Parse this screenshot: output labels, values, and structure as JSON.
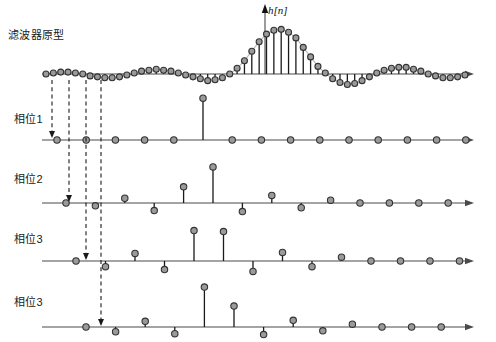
{
  "figure": {
    "title_label": "滤波器原型",
    "signal_label": "h[n]",
    "row_labels": [
      "相位1",
      "相位2",
      "相位3",
      "相位3"
    ],
    "colors": {
      "axis": "#4a4a4a",
      "stem": "#1a1a1a",
      "marker_fill": "#9a9a9a",
      "marker_stroke": "#333333",
      "envelope": "#b9b9b9",
      "dashed": "#1a1a1a",
      "text": "#1a1a1a"
    },
    "icons": {
      "axis_arrow": "axis-arrow-icon",
      "down_arrow": "down-arrow-icon",
      "up_arrow": "up-arrow-icon"
    }
  },
  "chart_data": {
    "type": "scatter",
    "title": "滤波器原型",
    "xlabel": "",
    "ylabel": "h[n]",
    "grid": false,
    "legend": false,
    "prototype": {
      "name": "h[n]",
      "baseline_y": 74,
      "x_start": 46,
      "x_step": 7.35,
      "ylim": [
        -14,
        52
      ],
      "values": [
        0,
        1,
        2,
        2,
        1,
        0,
        -2,
        -3,
        -4,
        -4,
        -3,
        -1,
        1,
        3,
        4,
        5,
        4,
        3,
        1,
        -1,
        -3,
        -5,
        -7,
        -6,
        -4,
        0,
        6,
        14,
        24,
        34,
        42,
        46,
        47,
        44,
        38,
        28,
        18,
        8,
        1,
        -5,
        -9,
        -11,
        -10,
        -7,
        -3,
        1,
        4,
        6,
        7,
        7,
        5,
        3,
        0,
        -2,
        -4,
        -4,
        -3,
        -1,
        1,
        3,
        4,
        4,
        3,
        2,
        0
      ]
    },
    "phases": [
      {
        "name": "相位1",
        "baseline_y": 140,
        "x_start": 57,
        "x_step": 29.2,
        "ylim": [
          -8,
          50
        ],
        "values": [
          0,
          0,
          0,
          0,
          0,
          44,
          0,
          0,
          0,
          0,
          0,
          0,
          0,
          0,
          0
        ]
      },
      {
        "name": "相位2",
        "baseline_y": 203,
        "x_start": 66,
        "x_step": 29.4,
        "ylim": [
          -14,
          44
        ],
        "values": [
          0,
          -3,
          5,
          -8,
          17,
          38,
          -9,
          8,
          -5,
          3,
          0,
          0,
          0,
          0,
          0
        ]
      },
      {
        "name": "相位3",
        "baseline_y": 261,
        "x_start": 76,
        "x_step": 29.5,
        "ylim": [
          -14,
          44
        ],
        "values": [
          0,
          -6,
          8,
          -9,
          32,
          31,
          -11,
          9,
          -6,
          4,
          0,
          0,
          0,
          0,
          0
        ]
      },
      {
        "name": "相位3",
        "baseline_y": 327,
        "x_start": 86,
        "x_step": 29.6,
        "ylim": [
          -12,
          46
        ],
        "values": [
          0,
          -5,
          6,
          -7,
          42,
          22,
          -8,
          7,
          -4,
          3,
          0,
          0,
          0,
          0,
          0
        ]
      }
    ],
    "routing_arrows": [
      {
        "x": 52,
        "y_start": 80,
        "y_end": 132,
        "target_row": 0
      },
      {
        "x": 69,
        "y_start": 80,
        "y_end": 196,
        "target_row": 1
      },
      {
        "x": 86,
        "y_start": 80,
        "y_end": 254,
        "target_row": 2
      },
      {
        "x": 101,
        "y_start": 80,
        "y_end": 320,
        "target_row": 3
      }
    ]
  }
}
